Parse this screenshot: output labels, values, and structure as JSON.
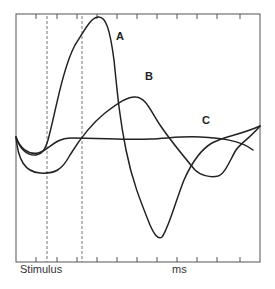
{
  "chart_data": {
    "type": "line",
    "title": "",
    "xlabel": "ms",
    "ylabel": "",
    "x_annotation": "Stimulus",
    "grid": false,
    "legend": "inline labels",
    "frame": {
      "left": 16,
      "top": 14,
      "right": 260,
      "bottom": 262
    },
    "tick_x": [
      36,
      57,
      77,
      97,
      117,
      137,
      157,
      177,
      197,
      217,
      240
    ],
    "dashed_markers_x": [
      47,
      82
    ],
    "series": [
      {
        "name": "A",
        "label_pos": [
          116,
          30
        ],
        "path": "M16,137 C20,150 28,156 36,155 C42,154 45,150 48,140 C55,115 62,70 75,45 C85,30 90,18 98,17 C106,16 110,30 114,60 C118,100 120,120 126,150 C132,180 140,200 150,225 C154,234 158,240 162,237 C168,230 176,200 184,180 C192,162 200,150 212,143 C225,136 240,135 260,126"
      },
      {
        "name": "B",
        "label_pos": [
          146,
          70
        ],
        "path": "M16,137 C18,160 25,172 40,173 C55,174 62,170 70,155 C78,142 90,125 105,113 C118,103 128,96 136,97 C146,98 150,110 160,125 C170,140 180,152 195,170 C200,175 210,178 218,176 C225,174 230,160 236,150 C242,142 250,138 260,126"
      },
      {
        "name": "C",
        "label_pos": [
          202,
          114
        ],
        "path": "M16,137 C20,148 28,155 38,153 C48,151 55,138 70,138 C100,138 130,140 150,139 C170,138 185,136 200,137 C220,138 240,140 253,150"
      }
    ]
  },
  "labels": {
    "a": "A",
    "b": "B",
    "c": "C",
    "stimulus": "Stimulus",
    "ms": "ms"
  }
}
